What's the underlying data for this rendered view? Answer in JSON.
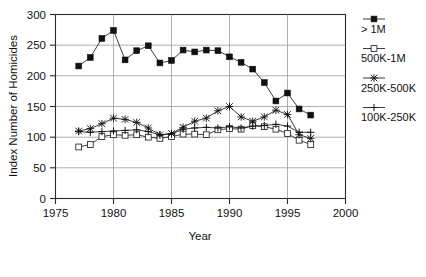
{
  "chart_data": {
    "type": "line",
    "title": "",
    "xlabel": "Year",
    "ylabel": "Index Number of Homicides",
    "xlim": [
      1975,
      2000
    ],
    "ylim": [
      0,
      300
    ],
    "xticks": [
      1975,
      1980,
      1985,
      1990,
      1995,
      2000
    ],
    "yticks": [
      0,
      50,
      100,
      150,
      200,
      250,
      300
    ],
    "grid": true,
    "legend_position": "right",
    "x": [
      1977,
      1978,
      1979,
      1980,
      1981,
      1982,
      1983,
      1984,
      1985,
      1986,
      1987,
      1988,
      1989,
      1990,
      1991,
      1992,
      1993,
      1994,
      1995,
      1996,
      1997
    ],
    "series": [
      {
        "name": "> 1M",
        "marker": "filled-square",
        "values": [
          216,
          230,
          261,
          274,
          226,
          241,
          249,
          221,
          225,
          242,
          239,
          242,
          241,
          231,
          222,
          211,
          189,
          159,
          172,
          146,
          136
        ]
      },
      {
        "name": "500K-1M",
        "marker": "open-square",
        "values": [
          84,
          88,
          101,
          104,
          103,
          104,
          100,
          98,
          101,
          105,
          105,
          104,
          112,
          114,
          113,
          119,
          117,
          113,
          106,
          95,
          88
        ]
      },
      {
        "name": "250K-500K",
        "marker": "asterisk",
        "values": [
          110,
          114,
          122,
          131,
          129,
          124,
          115,
          104,
          106,
          116,
          126,
          131,
          143,
          150,
          133,
          126,
          133,
          144,
          137,
          104,
          98
        ]
      },
      {
        "name": "100K-250K",
        "marker": "plus",
        "values": [
          109,
          108,
          109,
          110,
          111,
          112,
          109,
          104,
          105,
          113,
          115,
          116,
          115,
          117,
          115,
          118,
          119,
          121,
          118,
          108,
          108
        ]
      }
    ]
  },
  "legend": {
    "entries": [
      {
        "label": "> 1M"
      },
      {
        "label": "500K-1M"
      },
      {
        "label": "250K-500K"
      },
      {
        "label": "100K-250K"
      }
    ]
  },
  "axes": {
    "x_title": "Year",
    "y_title": "Index Number of Homicides",
    "x_tick_labels": [
      "1975",
      "1980",
      "1985",
      "1990",
      "1995",
      "2000"
    ],
    "y_tick_labels": [
      "0",
      "50",
      "100",
      "150",
      "200",
      "250",
      "300"
    ]
  }
}
